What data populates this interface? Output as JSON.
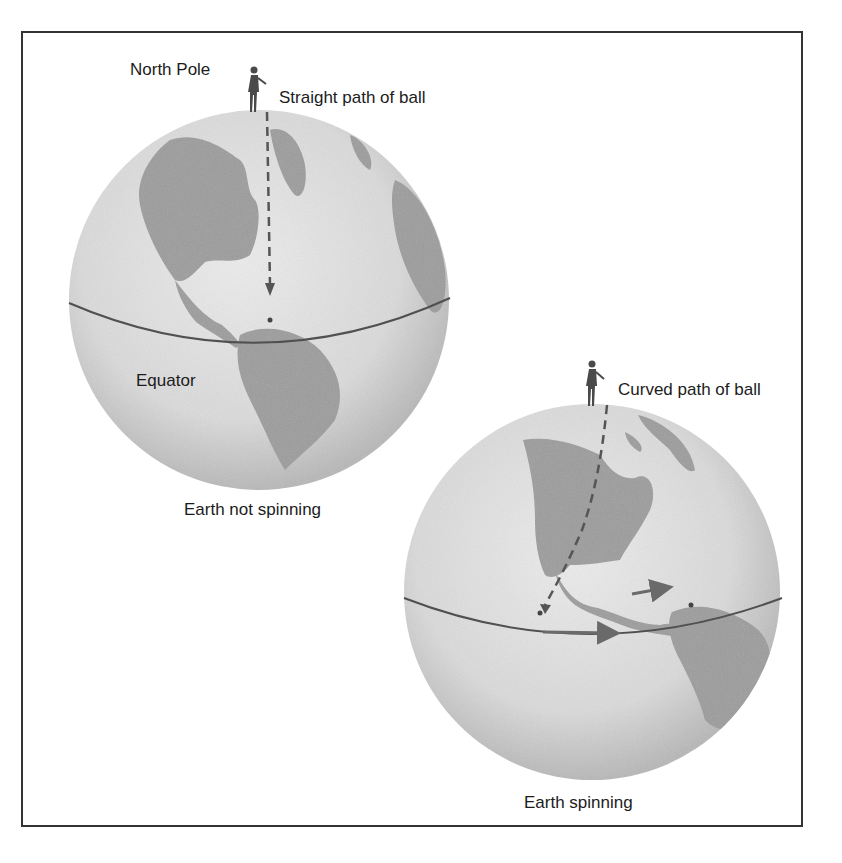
{
  "diagram": {
    "labels": {
      "north_pole": "North Pole",
      "straight_path": "Straight path of ball",
      "equator": "Equator",
      "earth_not_spinning": "Earth not spinning",
      "curved_path": "Curved path of ball",
      "earth_spinning": "Earth spinning"
    },
    "panels": [
      {
        "id": "not-spinning",
        "caption": "Earth not spinning",
        "path": "straight"
      },
      {
        "id": "spinning",
        "caption": "Earth spinning",
        "path": "curved",
        "rotation_arrows": 2
      }
    ],
    "colors": {
      "ocean": "#dcdcdc",
      "land": "#9a9a9a",
      "shade": "#b5b5b5",
      "line": "#555555",
      "frame": "#333333"
    }
  }
}
